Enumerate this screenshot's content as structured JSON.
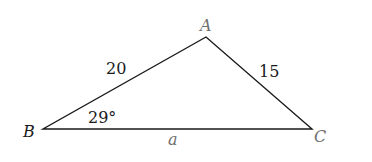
{
  "diagram": {
    "type": "triangle",
    "vertices": {
      "A": {
        "label": "A",
        "x": 206,
        "y": 37
      },
      "B": {
        "label": "B",
        "x": 43,
        "y": 129
      },
      "C": {
        "label": "C",
        "x": 312,
        "y": 129
      }
    },
    "sides": {
      "AB": {
        "label": "20"
      },
      "AC": {
        "label": "15"
      },
      "BC": {
        "label": "a"
      }
    },
    "angles": {
      "B": {
        "label": "29°"
      }
    },
    "colors": {
      "line": "#1a1a1a",
      "label_dark": "#1a1a1a",
      "label_gray": "#6f6f6f"
    }
  }
}
